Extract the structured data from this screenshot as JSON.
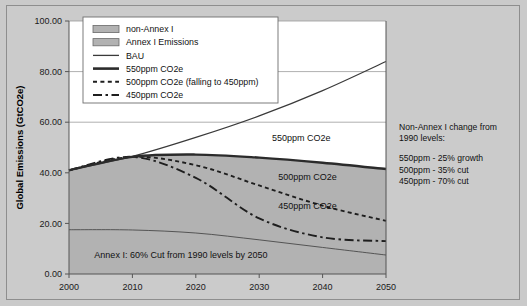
{
  "chart_data": {
    "type": "line",
    "title": "",
    "xlabel": "",
    "ylabel": "Global Emissions (GtCO2e)",
    "xlim": [
      2000,
      2050
    ],
    "ylim": [
      0,
      100
    ],
    "xticks": [
      "2000",
      "2010",
      "2020",
      "2030",
      "2040",
      "2050"
    ],
    "yticks": [
      "0.00",
      "20.00",
      "40.00",
      "60.00",
      "80.00",
      "100.00"
    ],
    "grid": true,
    "legend_position": "top-left-inside",
    "x": [
      2000,
      2010,
      2020,
      2030,
      2040,
      2050
    ],
    "series": [
      {
        "name": "BAU",
        "style": "thin-solid",
        "values": [
          41.0,
          46.5,
          54.0,
          62.5,
          72.5,
          84.0
        ]
      },
      {
        "name": "550ppm CO2e",
        "style": "thick-solid",
        "values": [
          41.0,
          46.3,
          47.2,
          46.0,
          44.0,
          41.5
        ]
      },
      {
        "name": "500ppm CO2e (falling to 450ppm)",
        "style": "dotted",
        "values": [
          41.0,
          46.3,
          43.0,
          35.0,
          27.0,
          21.0
        ]
      },
      {
        "name": "450ppm CO2e",
        "style": "dash-dot",
        "values": [
          41.0,
          46.3,
          38.0,
          22.0,
          14.5,
          13.0
        ]
      },
      {
        "name": "Annex I Emissions",
        "style": "area-boundary",
        "values": [
          17.5,
          17.4,
          16.2,
          13.5,
          10.5,
          7.5
        ]
      }
    ],
    "areas": [
      {
        "name": "non-Annex I",
        "upper_series": "550ppm CO2e",
        "lower_series": "Annex I Emissions"
      },
      {
        "name": "Annex I Emissions",
        "upper_series": "Annex I Emissions",
        "lower": 0
      }
    ],
    "annotations": [
      {
        "name": "label-550",
        "text": "550ppm CO2e",
        "x": 2032,
        "y": 52.5
      },
      {
        "name": "label-500",
        "text": "500ppm CO2e",
        "x": 2033,
        "y": 37.0
      },
      {
        "name": "label-450",
        "text": "450ppm CO2e",
        "x": 2033,
        "y": 25.5
      },
      {
        "name": "label-annex",
        "text": "Annex I: 60% Cut from 1990 levels by 2050",
        "x": 2004,
        "y": 6.5
      }
    ]
  },
  "legend": {
    "items": [
      {
        "label": "non-Annex I",
        "swatch": "fill-swatch"
      },
      {
        "label": "Annex I Emissions",
        "swatch": "fill-swatch"
      },
      {
        "label": "BAU",
        "swatch": "thin-line"
      },
      {
        "label": "550ppm CO2e",
        "swatch": "thick-line"
      },
      {
        "label": "500ppm CO2e (falling to 450ppm)",
        "swatch": "dotted-line"
      },
      {
        "label": "450ppm CO2e",
        "swatch": "dashdot-line"
      }
    ]
  },
  "side_note": {
    "heading_line1": "Non-Annex I change from",
    "heading_line2": "1990 levels:",
    "rows": [
      "550ppm - 25% growth",
      "500ppm - 35% cut",
      "450ppm - 70% cut"
    ]
  },
  "colors": {
    "background": "#cbcbcb",
    "plot_background": "#ffffff",
    "area_fill": "#b2b2b2",
    "line_dark": "#1e1e1e",
    "gridline": "#9a9a9a"
  }
}
